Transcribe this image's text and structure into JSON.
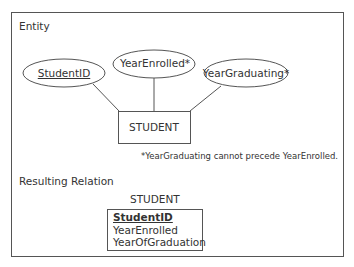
{
  "entity_section": {
    "heading": "Entity",
    "entity_name": "STUDENT",
    "attributes": [
      {
        "label": "StudentID",
        "key": true
      },
      {
        "label": "YearEnrolled*",
        "key": false
      },
      {
        "label": "YearGraduating*",
        "key": false
      }
    ],
    "footnote": "*YearGraduating cannot precede YearEnrolled."
  },
  "relation_section": {
    "heading": "Resulting Relation",
    "relation_name": "STUDENT",
    "columns": [
      {
        "label": "StudentID",
        "primary_key": true
      },
      {
        "label": "YearEnrolled",
        "primary_key": false
      },
      {
        "label": "YearOfGraduation",
        "primary_key": false
      }
    ]
  },
  "colors": {
    "stroke": "#555555",
    "text": "#333333",
    "background": "#ffffff"
  }
}
